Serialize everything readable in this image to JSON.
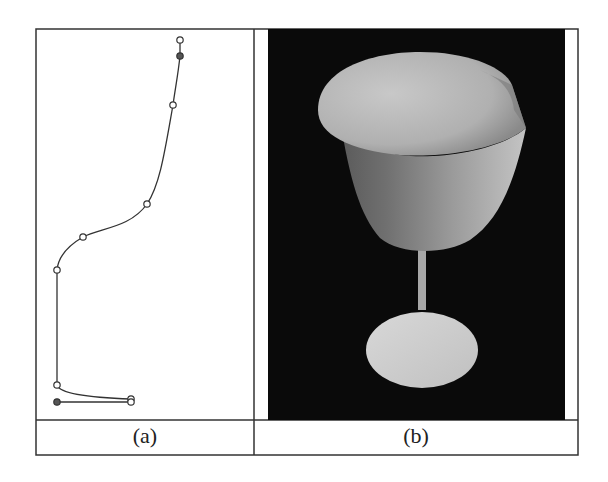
{
  "figure": {
    "panels": [
      {
        "id": "a",
        "caption": "(a)",
        "description": "Profile curve with control points",
        "curve_color": "#333333",
        "control_points": [
          {
            "x": 180,
            "y": 40,
            "style": "open"
          },
          {
            "x": 180,
            "y": 56,
            "style": "filled"
          },
          {
            "x": 173,
            "y": 105,
            "style": "open"
          },
          {
            "x": 147,
            "y": 204,
            "style": "open"
          },
          {
            "x": 83,
            "y": 237,
            "style": "open"
          },
          {
            "x": 57,
            "y": 270,
            "style": "open"
          },
          {
            "x": 57,
            "y": 385,
            "style": "open"
          },
          {
            "x": 131,
            "y": 399,
            "style": "open"
          },
          {
            "x": 131,
            "y": 402,
            "style": "open"
          },
          {
            "x": 57,
            "y": 402,
            "style": "filled"
          }
        ]
      },
      {
        "id": "b",
        "caption": "(b)",
        "description": "Rendered goblet surface of revolution",
        "background_color": "#0a0a0a",
        "surface_color": "#bdbdbd"
      }
    ],
    "frame_color": "#333333"
  }
}
